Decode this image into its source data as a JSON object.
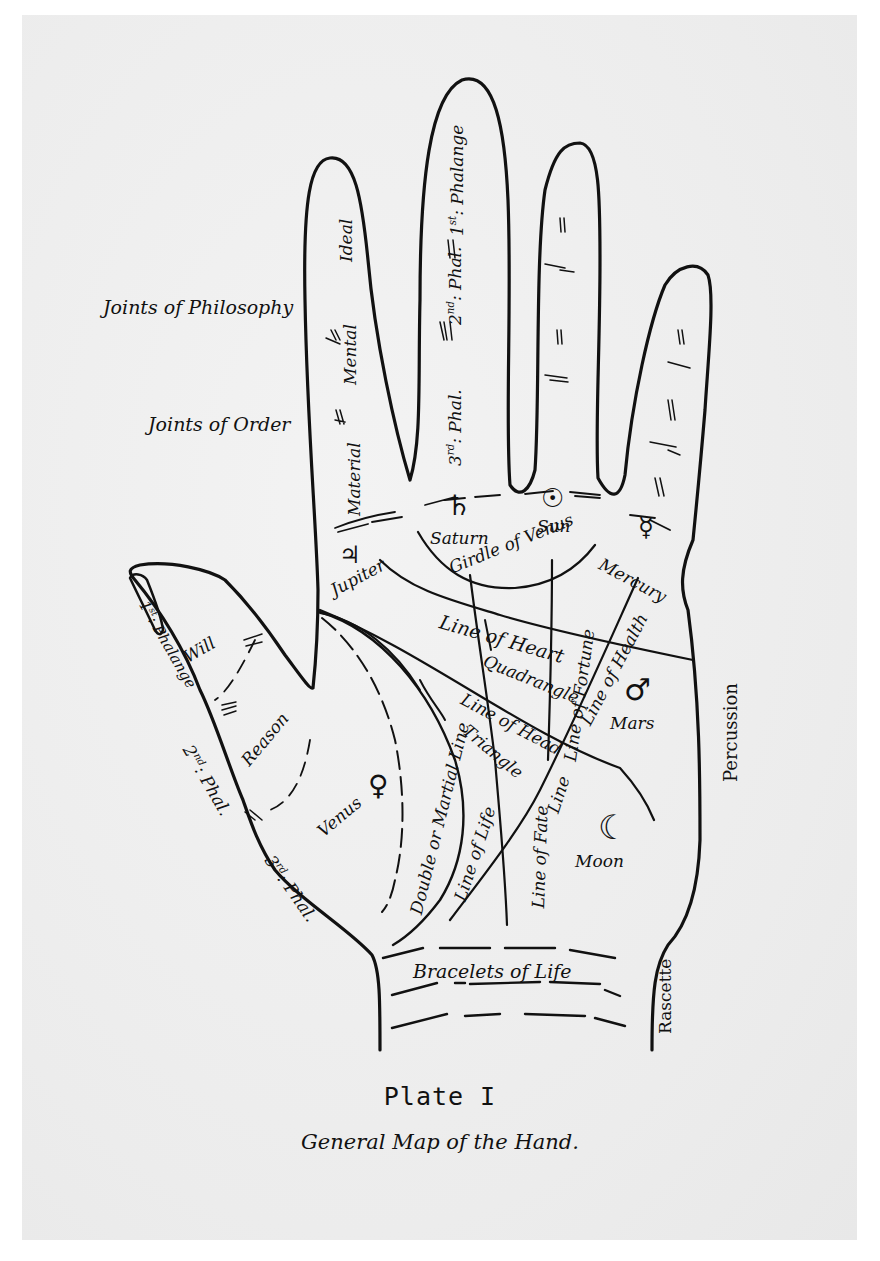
{
  "plate": {
    "title": "Plate I",
    "caption": "General Map of the Hand."
  },
  "side_labels": {
    "joints_of_philosophy": "Joints of Philosophy",
    "joints_of_order": "Joints of Order"
  },
  "fingers": {
    "index": {
      "ideal": "Ideal",
      "mental": "Mental",
      "material": "Material"
    },
    "middle": {
      "first_phalange": "1st Phalange",
      "second_phal": "2nd Phal.",
      "third_phal": "3rd Phal."
    }
  },
  "thumb": {
    "first_phalange": "1st Phalange",
    "second_phal": "2nd Phal.",
    "third_phal": "3rd Phal.",
    "will": "Will",
    "reason": "Reason"
  },
  "mounts": {
    "jupiter": {
      "symbol": "♃",
      "label": "Jupiter"
    },
    "saturn": {
      "symbol": "♄",
      "label": "Saturn"
    },
    "sun": {
      "symbol": "☉",
      "label": "Sun"
    },
    "mercury": {
      "symbol": "☿",
      "label": "Mercury"
    },
    "mars": {
      "symbol": "♂",
      "label": "Mars"
    },
    "venus": {
      "symbol": "♀",
      "label": "Venus"
    },
    "moon": {
      "symbol": "☽",
      "label": "Moon"
    }
  },
  "lines": {
    "girdle_of_venus": "Girdle of Venus",
    "line_of_heart": "Line of Heart",
    "quadrangle": "Quadrangle",
    "line_of_fortune": "Line of Fortune",
    "line_of_health": "Line of Health",
    "line_of_head": "Line of Head",
    "triangle": "Triangle",
    "double_or_martial_line": "Double or Martial Line",
    "line_of_life": "Line of Life",
    "line_of_fate": "Line of Fate",
    "bracelets_of_life": "Bracelets of Life",
    "percussion": "Percussion",
    "rascette": "Rascette"
  },
  "colors": {
    "ink": "#111111",
    "paper": "#efefef",
    "background": "#ffffff"
  }
}
